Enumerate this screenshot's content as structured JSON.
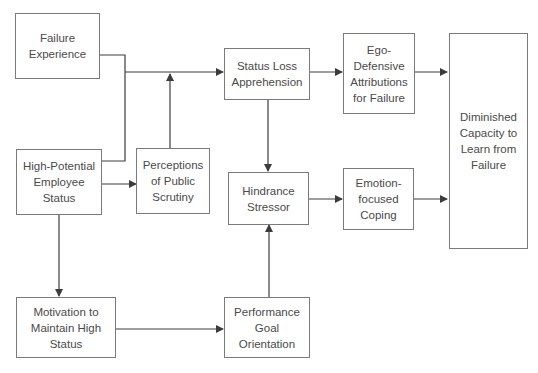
{
  "diagram": {
    "nodes": {
      "failure_experience": "Failure Experience",
      "high_potential": "High-Potential Employee Status",
      "public_scrutiny": "Perceptions of Public Scrutiny",
      "status_loss": "Status Loss Apprehension",
      "hindrance": "Hindrance Stressor",
      "ego_defensive": "Ego-Defensive Attributions for Failure",
      "emotion_coping": "Emotion-focused Coping",
      "diminished": "Diminished Capacity to Learn from Failure",
      "motivation": "Motivation to Maintain High Status",
      "performance_goal": "Performance Goal Orientation"
    },
    "edges": [
      {
        "from": "failure_experience",
        "to": "status_loss"
      },
      {
        "from": "high_potential",
        "to": "status_loss"
      },
      {
        "from": "high_potential",
        "to": "public_scrutiny"
      },
      {
        "from": "public_scrutiny",
        "to": "status_loss"
      },
      {
        "from": "high_potential",
        "to": "motivation"
      },
      {
        "from": "status_loss",
        "to": "ego_defensive"
      },
      {
        "from": "status_loss",
        "to": "hindrance"
      },
      {
        "from": "ego_defensive",
        "to": "diminished"
      },
      {
        "from": "hindrance",
        "to": "emotion_coping"
      },
      {
        "from": "emotion_coping",
        "to": "diminished"
      },
      {
        "from": "motivation",
        "to": "performance_goal"
      },
      {
        "from": "performance_goal",
        "to": "hindrance"
      }
    ],
    "line_color": "#3c3c3c",
    "border_color": "#7a7a7a"
  }
}
